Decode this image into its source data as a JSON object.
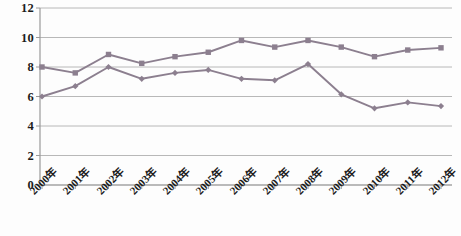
{
  "chart_data": {
    "type": "line",
    "title": "",
    "xlabel": "",
    "ylabel": "",
    "categories": [
      "2000年",
      "2001年",
      "2002年",
      "2003年",
      "2004年",
      "2005年",
      "2006年",
      "2007年",
      "2008年",
      "2009年",
      "2010年",
      "2011年",
      "2012年"
    ],
    "yticks": [
      0,
      2,
      4,
      6,
      8,
      10,
      12
    ],
    "ylim": [
      0,
      12
    ],
    "grid": "horizontal",
    "legend": "none",
    "series": [
      {
        "name": "series-1",
        "marker": "square",
        "color": "#8c7f8f",
        "values": [
          8.0,
          7.6,
          8.85,
          8.25,
          8.7,
          9.0,
          9.8,
          9.35,
          9.8,
          9.35,
          8.7,
          9.15,
          9.3
        ]
      },
      {
        "name": "series-2",
        "marker": "diamond",
        "color": "#8c7f8f",
        "values": [
          6.0,
          6.7,
          8.0,
          7.2,
          7.6,
          7.8,
          7.2,
          7.1,
          8.2,
          6.15,
          5.2,
          5.6,
          5.35
        ]
      }
    ],
    "axis_color": "#9a9a9a",
    "grid_color": "#b0b0b0",
    "text_color": "#1c1c1c"
  }
}
